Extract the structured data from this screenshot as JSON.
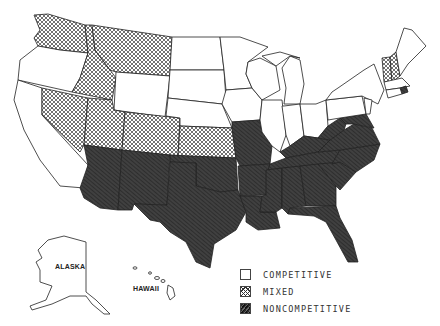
{
  "map": {
    "title": "",
    "type": "choropleth",
    "region": "United States",
    "insets": [
      {
        "label": "ALASKA",
        "category": "competitive"
      },
      {
        "label": "HAWAII",
        "category": "competitive"
      }
    ],
    "categories": {
      "competitive": {
        "label": "COMPETITIVE",
        "pattern": "white/blank"
      },
      "mixed": {
        "label": "MIXED",
        "pattern": "cross-hatch"
      },
      "noncompetitive": {
        "label": "NONCOMPETITIVE",
        "pattern": "dark diagonal hatch"
      }
    },
    "regions": {
      "competitive": [
        "Oregon",
        "California",
        "Wyoming",
        "North Dakota",
        "South Dakota",
        "Nebraska",
        "Minnesota",
        "Iowa",
        "Wisconsin",
        "Illinois",
        "Michigan",
        "Indiana",
        "Ohio",
        "Pennsylvania",
        "New York",
        "New Jersey",
        "Maine",
        "Massachusetts",
        "Connecticut",
        "Alaska",
        "Hawaii"
      ],
      "mixed": [
        "Washington",
        "Idaho",
        "Montana",
        "Nevada",
        "Utah",
        "Colorado",
        "Kansas",
        "Vermont",
        "New Hampshire"
      ],
      "noncompetitive": [
        "Arizona",
        "New Mexico",
        "Texas",
        "Oklahoma",
        "Arkansas",
        "Missouri",
        "Louisiana",
        "Mississippi",
        "Alabama",
        "Georgia",
        "Florida",
        "Tennessee",
        "Kentucky",
        "South Carolina",
        "North Carolina",
        "Virginia",
        "West Virginia",
        "Maryland",
        "Delaware",
        "Rhode Island"
      ]
    }
  },
  "legend": {
    "items": [
      {
        "label": "COMPETITIVE",
        "key": "competitive"
      },
      {
        "label": "MIXED",
        "key": "mixed"
      },
      {
        "label": "NONCOMPETITIVE",
        "key": "noncompetitive"
      }
    ]
  }
}
